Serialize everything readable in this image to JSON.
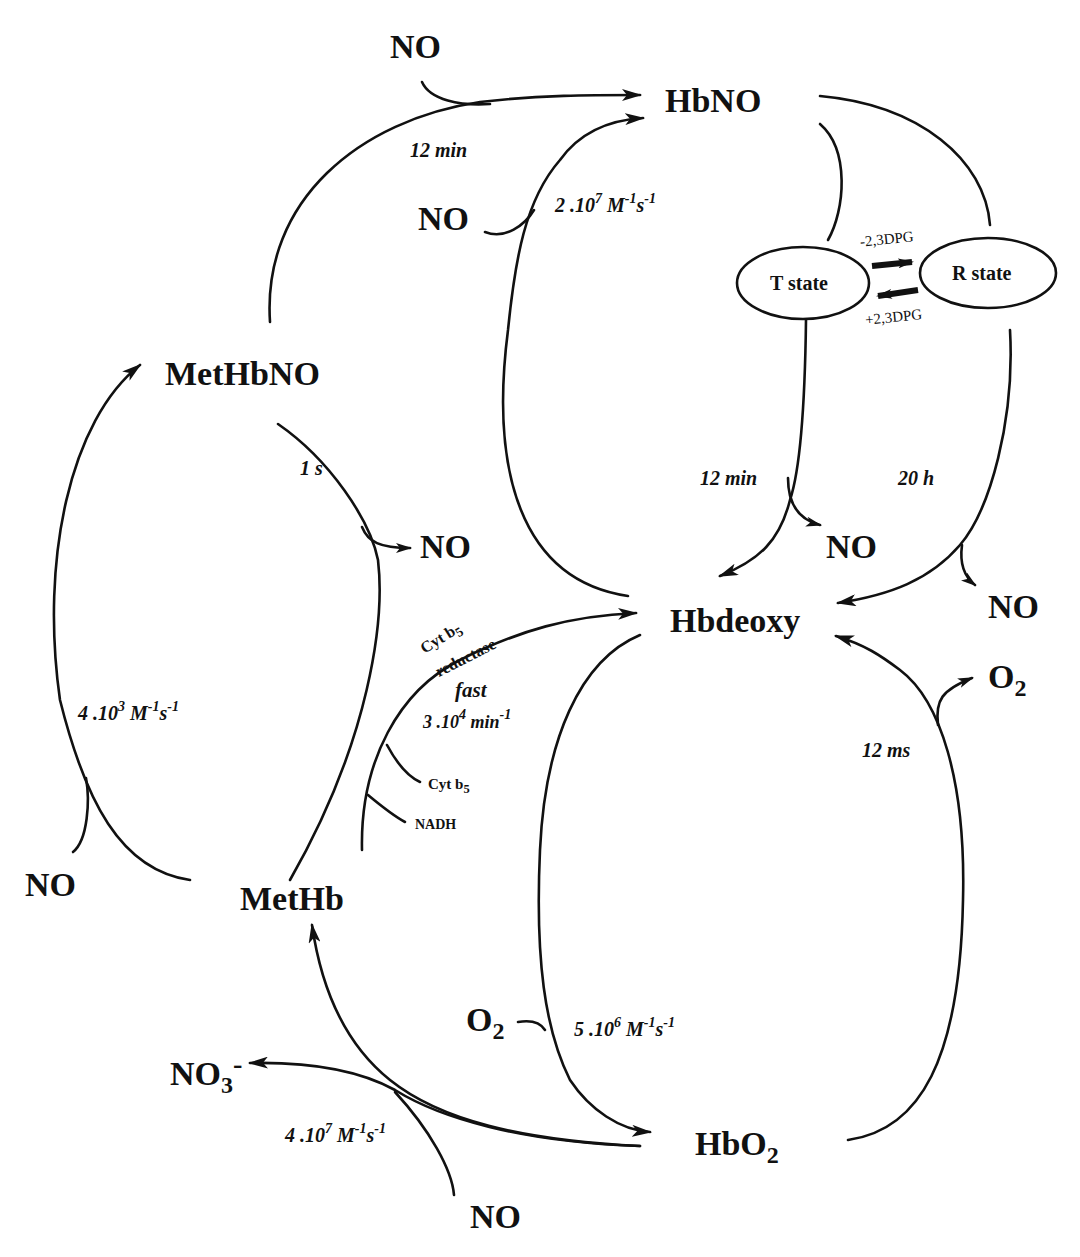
{
  "diagram": {
    "type": "reaction-scheme",
    "species": {
      "hbno": "HbNO",
      "methbno": "MetHbNO",
      "hbdeoxy": "Hbdeoxy",
      "methb": "MetHb",
      "hbo2_main": "HbO",
      "hbo2_sub": "2",
      "no3_main": "NO",
      "no3_sub": "3",
      "no3_charge": "-",
      "o2_main": "O",
      "o2_sub": "2",
      "no": "NO"
    },
    "states": {
      "t_state": "T state",
      "r_state": "R state",
      "minus_dpg": "-2,3DPG",
      "plus_dpg": "+2,3DPG"
    },
    "rates": {
      "methbno_to_hbno": "12 min",
      "hbdeoxy_to_hbno": {
        "base": "2 .10",
        "exp": "7",
        "unit_m": " M",
        "m_exp": "-1",
        "unit_s": "s",
        "s_exp": "-1"
      },
      "t_state_release": "12 min",
      "r_state_release": "20 h",
      "methbno_release": "1 s",
      "methb_to_methbno": {
        "base": "4 .10",
        "exp": "3",
        "unit_m": " M",
        "m_exp": "-1",
        "unit_s": "s",
        "s_exp": "-1"
      },
      "reductase_speed": "fast",
      "reductase_rate": {
        "base": "3 .10",
        "exp": "4",
        "unit": " min",
        "unit_exp": "-1"
      },
      "hbo2_release": "12 ms",
      "hbdeoxy_to_hbo2": {
        "base": "5 .10",
        "exp": "6",
        "unit_m": " M",
        "m_exp": "-1",
        "unit_s": "s",
        "s_exp": "-1"
      },
      "hbo2_to_methb": {
        "base": "4 .10",
        "exp": "7",
        "unit_m": " M",
        "m_exp": "-1",
        "unit_s": "s",
        "s_exp": "-1"
      }
    },
    "enzymes": {
      "cyt_b5_reductase_line1": "Cyt b",
      "cyt_b5_reductase_sub": "5",
      "cyt_b5_reductase_line2": "reductase",
      "cyt_b5": "Cyt b",
      "cyt_b5_sub": "5",
      "nadh": "NADH"
    },
    "colors": {
      "ink": "#111111",
      "background": "#ffffff"
    }
  }
}
